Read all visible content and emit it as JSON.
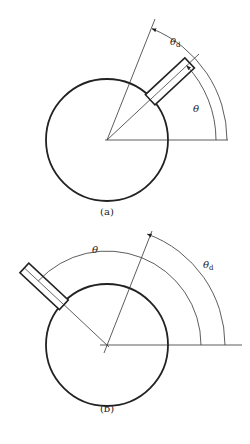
{
  "figure": {
    "panels": [
      {
        "id": "a",
        "caption": "(a)",
        "theta_label": "θ",
        "theta_d_label": "θ",
        "theta_d_sub": "d",
        "center": [
          107,
          140
        ],
        "radius": 61,
        "probe_angle_deg": 43,
        "ref_angle_deg": 68
      },
      {
        "id": "b",
        "caption": "(b)",
        "theta_label": "θ",
        "theta_d_label": "θ",
        "theta_d_sub": "d",
        "center": [
          107,
          345
        ],
        "radius": 61,
        "probe_angle_deg": 137,
        "ref_angle_deg": 70
      }
    ],
    "colors": {
      "stroke": "#222222",
      "background": "#ffffff"
    }
  }
}
